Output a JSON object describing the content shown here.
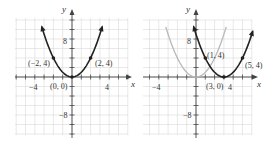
{
  "chart_data": [
    {
      "type": "line",
      "title": "",
      "function": "y = x^2",
      "xlabel": "x",
      "ylabel": "y",
      "xlim": [
        -6,
        6
      ],
      "ylim": [
        -12,
        12
      ],
      "x_tick_labels": [
        "-4",
        "4"
      ],
      "y_tick_labels": [
        "8",
        "-8"
      ],
      "grid": true,
      "series": [
        {
          "name": "y = x^2",
          "color": "#222222",
          "x": [
            -3.2,
            -2,
            0,
            2,
            3.2
          ],
          "y": [
            10.24,
            4,
            0,
            4,
            10.24
          ]
        }
      ],
      "points": [
        {
          "label": "(-2, 4)",
          "x": -2,
          "y": 4
        },
        {
          "label": "(0, 0)",
          "x": 0,
          "y": 0
        },
        {
          "label": "(2, 4)",
          "x": 2,
          "y": 4
        }
      ]
    },
    {
      "type": "line",
      "title": "",
      "function": "y = (x - 3)^2",
      "xlabel": "x",
      "ylabel": "y",
      "xlim": [
        -6,
        6
      ],
      "ylim": [
        -12,
        12
      ],
      "x_tick_labels": [
        "-4",
        "4"
      ],
      "y_tick_labels": [
        "8",
        "-8"
      ],
      "grid": true,
      "series": [
        {
          "name": "y = x^2 (reference)",
          "color": "#bbbbbb",
          "x": [
            -3.2,
            0,
            3.2
          ],
          "y": [
            10.24,
            0,
            10.24
          ]
        },
        {
          "name": "y = (x - 3)^2",
          "color": "#222222",
          "x": [
            -0.2,
            1,
            3,
            5,
            6.2
          ],
          "y": [
            10.24,
            4,
            0,
            4,
            10.24
          ]
        }
      ],
      "points": [
        {
          "label": "(1, 4)",
          "x": 1,
          "y": 4
        },
        {
          "label": "(3, 0)",
          "x": 3,
          "y": 0
        },
        {
          "label": "(5, 4)",
          "x": 5,
          "y": 4
        }
      ]
    }
  ],
  "labels": {
    "left": {
      "y": "y",
      "x": "x",
      "xneg": "−4",
      "xpos": "4",
      "ypos": "8",
      "yneg": "−8",
      "p1": "(−2, 4)",
      "p2": "(0, 0)",
      "p3": "(2, 4)"
    },
    "right": {
      "y": "y",
      "x": "x",
      "xneg": "−4",
      "xpos": "4",
      "ypos": "8",
      "yneg": "−8",
      "p1": "(1, 4)",
      "p2": "(3, 0)",
      "p3": "(5, 4)"
    }
  }
}
